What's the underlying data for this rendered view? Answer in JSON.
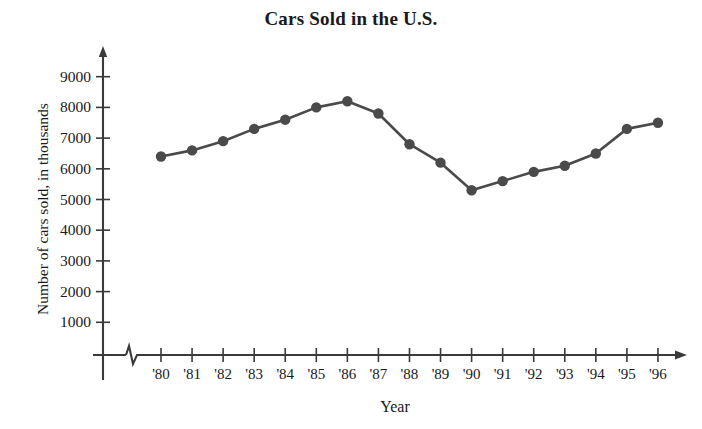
{
  "chart_data": {
    "type": "line",
    "title": "Cars Sold in the U.S.",
    "xlabel": "Year",
    "ylabel": "Number of cars sold, in thousands",
    "categories": [
      "'80",
      "'81",
      "'82",
      "'83",
      "'84",
      "'85",
      "'86",
      "'87",
      "'88",
      "'89",
      "'90",
      "'91",
      "'92",
      "'93",
      "'94",
      "'95",
      "'96"
    ],
    "values": [
      6400,
      6600,
      6900,
      7300,
      7600,
      8000,
      8200,
      7800,
      6800,
      6200,
      5300,
      5600,
      5900,
      6100,
      6500,
      7300,
      7500
    ],
    "ytick_labels": [
      "9000",
      "8000",
      "7000",
      "6000",
      "5000",
      "4000",
      "3000",
      "2000",
      "1000"
    ],
    "ytick_values": [
      9000,
      8000,
      7000,
      6000,
      5000,
      4000,
      3000,
      2000,
      1000
    ],
    "ylim": [
      0,
      9600
    ],
    "xlim": [
      "'80",
      "'96"
    ],
    "grid": false,
    "legend": false,
    "axis_break_x": true,
    "series_color": "#4a4a4a",
    "axis_color": "#3a3a3a",
    "marker": "circle"
  }
}
